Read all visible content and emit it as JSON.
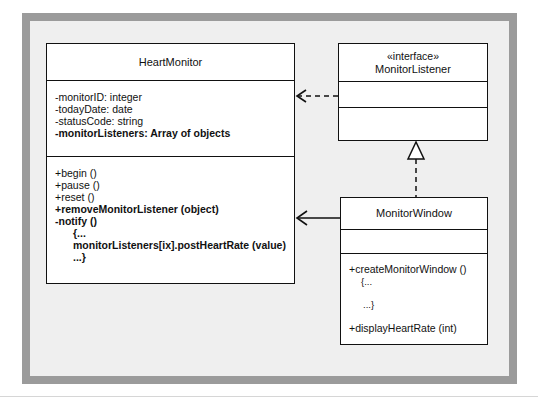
{
  "diagram": {
    "type": "UML class diagram",
    "classes": [
      {
        "id": "heart-monitor",
        "name": "HeartMonitor",
        "attributes": [
          {
            "text": "-monitorID: integer",
            "bold": false
          },
          {
            "text": "-todayDate: date",
            "bold": false
          },
          {
            "text": "-statusCode: string",
            "bold": false
          },
          {
            "text": "-monitorListeners: Array of objects",
            "bold": true
          }
        ],
        "methods": [
          {
            "text": "+begin ()",
            "bold": false
          },
          {
            "text": "+pause ()",
            "bold": false
          },
          {
            "text": "+reset ()",
            "bold": false
          },
          {
            "text": "+removeMonitorListener (object)",
            "bold": true
          },
          {
            "text": "-notify ()",
            "bold": true
          },
          {
            "text": "{...",
            "bold": true
          },
          {
            "text": "monitorListeners[ix].postHeartRate (value)",
            "bold": true
          },
          {
            "text": "...}",
            "bold": true
          }
        ]
      },
      {
        "id": "monitor-listener",
        "stereotype": "«interface»",
        "name": "MonitorListener",
        "attributes": [],
        "methods": []
      },
      {
        "id": "monitor-window",
        "name": "MonitorWindow",
        "attributes": [],
        "methods": [
          {
            "text": "+createMonitorWindow ()",
            "bold": false
          },
          {
            "text": "{...",
            "bold": false
          },
          {
            "text": "...}",
            "bold": false
          },
          {
            "text": "+displayHeartRate (int)",
            "bold": false
          }
        ]
      }
    ],
    "relationships": [
      {
        "from": "monitor-listener",
        "to": "heart-monitor",
        "kind": "dependency",
        "style": "dashed-open-arrow"
      },
      {
        "from": "monitor-window",
        "to": "heart-monitor",
        "kind": "association",
        "style": "solid-open-arrow"
      },
      {
        "from": "monitor-window",
        "to": "monitor-listener",
        "kind": "realization",
        "style": "dashed-hollow-triangle"
      }
    ]
  },
  "colors": {
    "frame_border": "#9b9b9b",
    "frame_fill": "#efefef",
    "box_fill": "#ffffff",
    "line": "#111111"
  }
}
